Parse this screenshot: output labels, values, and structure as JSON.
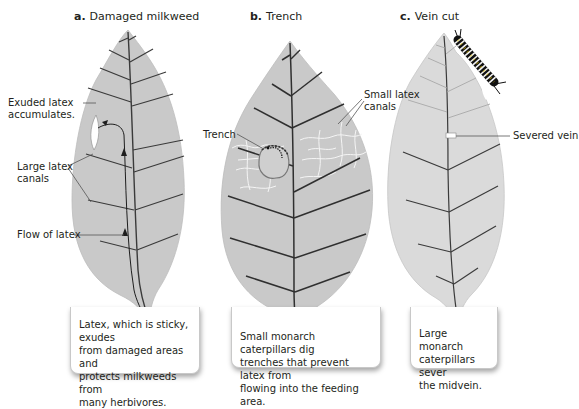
{
  "panels": [
    {
      "letter": "a.",
      "title": "Damaged milkweed",
      "labels": {
        "exuded": [
          "Exuded latex",
          "accumulates."
        ],
        "canals": [
          "Large latex",
          "canals"
        ],
        "flow": "Flow of latex"
      },
      "caption": [
        "Latex, which is sticky, exudes",
        "from damaged areas and",
        "protects milkweeds from",
        "many herbivores."
      ]
    },
    {
      "letter": "b.",
      "title": "Trench",
      "labels": {
        "trench": "Trench",
        "small_canals": [
          "Small latex",
          "canals"
        ]
      },
      "caption": [
        "Small monarch caterpillars dig",
        "trenches that prevent latex from",
        "flowing into the feeding area."
      ]
    },
    {
      "letter": "c.",
      "title": "Vein cut",
      "labels": {
        "severed": "Severed vein"
      },
      "caption": [
        "Large monarch",
        "caterpillars sever",
        "the midvein."
      ]
    }
  ],
  "colors": {
    "leaf_fill": "#c9c9c9",
    "leaf_fill_light": "#dedede",
    "vein": "#3a3a3a",
    "latex_canals": "#f4f4f4",
    "caption_bg": "#ffffff"
  }
}
